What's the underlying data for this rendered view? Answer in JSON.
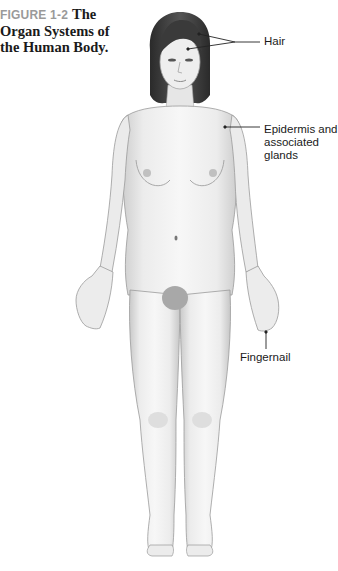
{
  "caption": {
    "figure_number": "FIGURE 1-2",
    "title_line1": "The",
    "title_line2": "Organ Systems of",
    "title_line3": "the Human Body."
  },
  "labels": {
    "hair": "Hair",
    "epidermis_line1": "Epidermis and",
    "epidermis_line2": "associated",
    "epidermis_line3": "glands",
    "fingernail": "Fingernail"
  },
  "colors": {
    "figure_number": "#9a9a9a",
    "title": "#1a1a1a",
    "skin_light": "#f2f2f2",
    "skin_shade": "#cfcfcf",
    "hair": "#3a3a3a",
    "leader_line": "#222222"
  }
}
